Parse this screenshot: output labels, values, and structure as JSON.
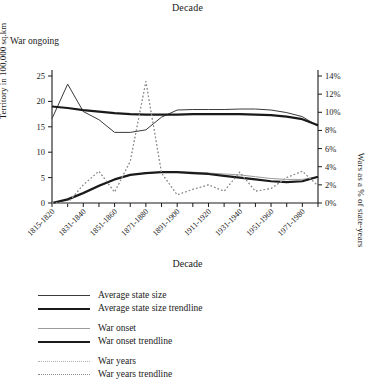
{
  "top_title": "Decade",
  "bottom_title": "Decade",
  "annotation": "War ongoing",
  "axes": {
    "left_label": "Territory in 100,000 sq.km",
    "right_label": "Wars as a % of state-years",
    "x_label": "Decade",
    "left_ticks": [
      "0",
      "5",
      "10",
      "15",
      "20",
      "25"
    ],
    "right_ticks": [
      "0%",
      "2%",
      "4%",
      "6%",
      "8%",
      "10%",
      "12%",
      "14%"
    ]
  },
  "legend": {
    "groups": [
      [
        {
          "label": "Average state size",
          "style": "thin-solid",
          "color": "#3a3a3a"
        },
        {
          "label": "Average state size trendline",
          "style": "thick-solid",
          "color": "#1a1a1a"
        }
      ],
      [
        {
          "label": "War onset",
          "style": "thin-solid-light",
          "color": "#9a9a9a"
        },
        {
          "label": "War onset trendline",
          "style": "thick-solid",
          "color": "#1a1a1a"
        }
      ],
      [
        {
          "label": "War years",
          "style": "dotted-light",
          "color": "#b0b0b0"
        },
        {
          "label": "War years trendline",
          "style": "dotted",
          "color": "#8a8a8a"
        }
      ]
    ]
  },
  "chart_data": {
    "type": "line",
    "title": "Decade",
    "xlabel": "Decade",
    "ylabel": "Territory in 100,000 sq.km",
    "y2label": "Wars as a % of state-years",
    "ylim": [
      0,
      25
    ],
    "y2lim": [
      0,
      14
    ],
    "grid": false,
    "legend_position": "below",
    "annotation": "War ongoing",
    "x": [
      "1815-1820",
      "1821-1830",
      "1831-1840",
      "1841-1850",
      "1851-1860",
      "1861-1870",
      "1871-1880",
      "1881-1890",
      "1891-1900",
      "1901-1910",
      "1911-1920",
      "1921-1930",
      "1931-1940",
      "1941-1950",
      "1951-1960",
      "1961-1970",
      "1971-1980",
      "1981-1990"
    ],
    "x_tick_labels": [
      "1815-1820",
      "1831-1840",
      "1851-1860",
      "1871-1880",
      "1891-1900",
      "1911-1920",
      "1931-1940",
      "1951-1960",
      "1971-1980"
    ],
    "series": [
      {
        "name": "Average state size",
        "axis": "left",
        "style": "thin-solid",
        "color": "#3a3a3a",
        "values": [
          16.6,
          23.4,
          18.0,
          16.4,
          13.9,
          13.9,
          14.4,
          16.9,
          18.3,
          18.4,
          18.4,
          18.4,
          18.5,
          18.5,
          18.3,
          17.8,
          17.0,
          15.1
        ]
      },
      {
        "name": "Average state size trendline",
        "axis": "left",
        "style": "thick-solid",
        "color": "#1a1a1a",
        "values": [
          19.0,
          18.7,
          18.3,
          18.0,
          17.7,
          17.5,
          17.4,
          17.4,
          17.4,
          17.5,
          17.5,
          17.5,
          17.5,
          17.4,
          17.3,
          17.0,
          16.5,
          15.3
        ]
      },
      {
        "name": "War onset",
        "axis": "right",
        "style": "thin-solid-light",
        "color": "#9a9a9a",
        "values": [
          0.0,
          0.3,
          1.0,
          1.8,
          2.6,
          3.1,
          3.3,
          3.4,
          3.4,
          3.4,
          3.3,
          3.2,
          3.1,
          2.9,
          2.7,
          2.6,
          2.6,
          2.9
        ]
      },
      {
        "name": "War onset trendline",
        "axis": "right",
        "style": "thick-solid",
        "color": "#1a1a1a",
        "values": [
          0.0,
          0.4,
          1.1,
          1.9,
          2.6,
          3.1,
          3.3,
          3.4,
          3.4,
          3.3,
          3.2,
          3.0,
          2.8,
          2.6,
          2.4,
          2.3,
          2.4,
          2.9
        ]
      },
      {
        "name": "War years",
        "axis": "right",
        "style": "dotted-light",
        "color": "#b0b0b0",
        "values": [
          0.0,
          0.0,
          2.0,
          3.5,
          1.2,
          4.6,
          13.4,
          3.3,
          0.9,
          1.5,
          2.0,
          1.3,
          3.4,
          1.3,
          1.6,
          2.8,
          3.5,
          1.9
        ]
      },
      {
        "name": "War years trendline",
        "axis": "right",
        "style": "dotted",
        "color": "#8a8a8a",
        "values": [
          0.0,
          0.0,
          2.0,
          3.5,
          1.2,
          4.6,
          13.4,
          3.3,
          0.9,
          1.5,
          2.0,
          1.3,
          3.4,
          1.3,
          1.6,
          2.8,
          3.5,
          1.9
        ]
      }
    ]
  }
}
